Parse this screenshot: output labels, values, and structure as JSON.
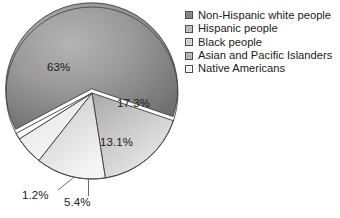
{
  "chart_data": {
    "type": "pie",
    "title": "",
    "subtitle": "",
    "xlabel": "",
    "ylabel": "",
    "legend_position": "right",
    "grid": false,
    "categories": [
      "Non-Hispanic white people",
      "Hispanic people",
      "Black people",
      "Asian and Pacific Islanders",
      "Native Americans"
    ],
    "values": [
      63,
      17.3,
      13.1,
      5.4,
      1.2
    ],
    "data_labels": [
      "63%",
      "17.3%",
      "13.1%",
      "5.4%",
      "1.2%"
    ],
    "colors": [
      "#8e8e8e",
      "#c9c9c9",
      "#dcdcdc",
      "#efefef",
      "#ffffff"
    ],
    "slices": [
      {
        "label": "Non-Hispanic white people",
        "value": 63,
        "data_label": "63%",
        "color": "#8e8e8e",
        "exploded": true,
        "label_placement": "inside"
      },
      {
        "label": "Hispanic people",
        "value": 17.3,
        "data_label": "17.3%",
        "color": "#c9c9c9",
        "exploded": false,
        "label_placement": "inside"
      },
      {
        "label": "Black people",
        "value": 13.1,
        "data_label": "13.1%",
        "color": "#dcdcdc",
        "exploded": false,
        "label_placement": "inside"
      },
      {
        "label": "Asian and Pacific Islanders",
        "value": 5.4,
        "data_label": "5.4%",
        "color": "#efefef",
        "exploded": false,
        "label_placement": "leader-line"
      },
      {
        "label": "Native Americans",
        "value": 1.2,
        "data_label": "1.2%",
        "color": "#ffffff",
        "exploded": false,
        "label_placement": "leader-line"
      }
    ]
  },
  "legend": {
    "items": [
      {
        "label": "Non-Hispanic white people",
        "color": "#8e8e8e"
      },
      {
        "label": "Hispanic people",
        "color": "#c9c9c9"
      },
      {
        "label": "Black people",
        "color": "#dcdcdc"
      },
      {
        "label": "Asian and Pacific Islanders",
        "color": "#bfbfbf"
      },
      {
        "label": "Native Americans",
        "color": "#ffffff"
      }
    ]
  }
}
